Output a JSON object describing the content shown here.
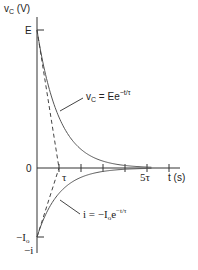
{
  "figure": {
    "y_axis_label": "v",
    "y_axis_label_sub": "C",
    "y_axis_unit": " (V)",
    "x_axis_label": "t (s)",
    "origin_label": "0",
    "E_label": "E",
    "tau_label": "τ",
    "five_tau_label": "5τ",
    "neg_I0_label": "−I",
    "neg_I0_sub": "o",
    "neg_i_label": "−i",
    "vc_eq": {
      "lhs": "v",
      "lhs_sub": "C",
      "rhs": " = Ee",
      "exp": "−t/τ"
    },
    "i_eq": {
      "lhs": "i = −I",
      "lhs_sub": "o",
      "rhs": "e",
      "exp": "−t/τ"
    },
    "colors": {
      "axis": "#333333",
      "curve": "#555555",
      "text": "#222222"
    }
  },
  "geometry": {
    "origin_x": 37,
    "baseline_y": 168,
    "E_y": 30,
    "neg_I0_y": 237,
    "tau_px": 22,
    "tick_count": 6
  }
}
